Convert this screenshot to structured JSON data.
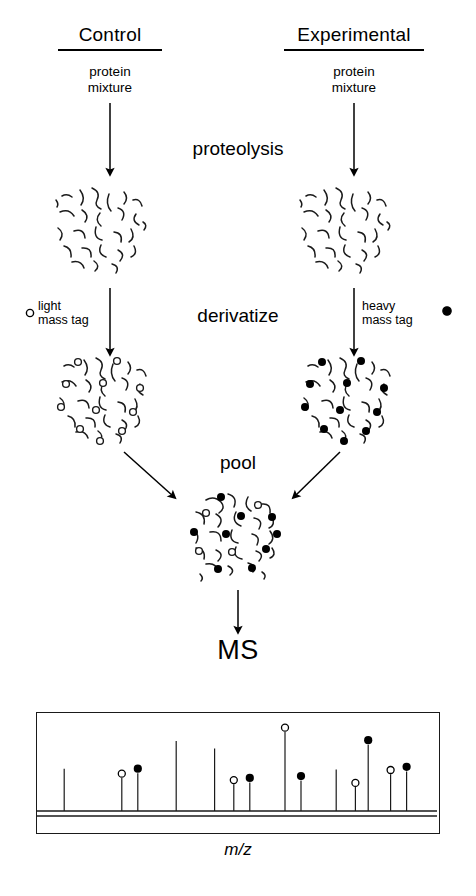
{
  "figure": {
    "title_columns": [
      {
        "id": "control",
        "label": "Control"
      },
      {
        "id": "experimental",
        "label": "Experimental"
      }
    ],
    "sample_label": "protein\nmixture",
    "sample_label_line1": "protein",
    "sample_label_line2": "mixture",
    "steps": [
      {
        "id": "proteolysis",
        "label": "proteolysis"
      },
      {
        "id": "derivatize",
        "label": "derivatize"
      },
      {
        "id": "pool",
        "label": "pool"
      },
      {
        "id": "ms",
        "label": "MS"
      }
    ],
    "tags": {
      "light": {
        "line1": "light",
        "line2": "mass tag",
        "marker": "open-circle",
        "fill": "#ffffff",
        "stroke": "#000000"
      },
      "heavy": {
        "line1": "heavy",
        "line2": "mass tag",
        "marker": "filled-circle",
        "fill": "#000000",
        "stroke": "#000000"
      }
    },
    "colors": {
      "ink": "#000000",
      "line": "#1a1a1a",
      "background": "#ffffff"
    }
  },
  "chart_data": {
    "type": "bar",
    "title": "MS",
    "xlabel": "m/z",
    "ylabel": "",
    "grid": false,
    "legend": [
      "light mass tag",
      "heavy mass tag"
    ],
    "xlim": [
      0,
      100
    ],
    "ylim": [
      0,
      100
    ],
    "note": "Mass spectrum: peak pairs of light (open circle) and heavy (filled circle) tagged peptides",
    "peaks": [
      {
        "x": 6,
        "height": 46,
        "tag": "none"
      },
      {
        "x": 24,
        "height": 36,
        "tag": "light"
      },
      {
        "x": 29,
        "height": 41,
        "tag": "heavy"
      },
      {
        "x": 41,
        "height": 76,
        "tag": "none"
      },
      {
        "x": 53,
        "height": 68,
        "tag": "none"
      },
      {
        "x": 59,
        "height": 29,
        "tag": "light"
      },
      {
        "x": 64,
        "height": 31,
        "tag": "heavy"
      },
      {
        "x": 75,
        "height": 86,
        "tag": "light"
      },
      {
        "x": 80,
        "height": 33,
        "tag": "heavy"
      },
      {
        "x": 91,
        "height": 45,
        "tag": "none"
      },
      {
        "x": 97,
        "height": 26,
        "tag": "light"
      },
      {
        "x": 101,
        "height": 72,
        "tag": "heavy"
      },
      {
        "x": 108,
        "height": 40,
        "tag": "light"
      },
      {
        "x": 113,
        "height": 43,
        "tag": "heavy"
      }
    ]
  }
}
